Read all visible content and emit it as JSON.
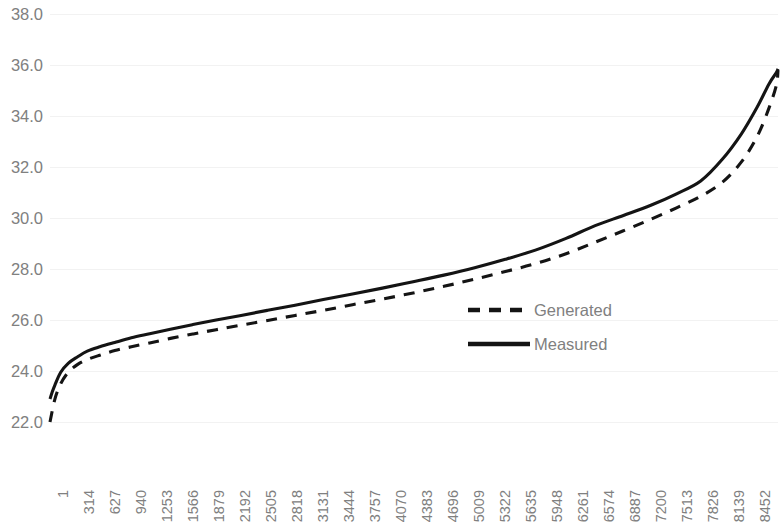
{
  "chart_data": {
    "type": "line",
    "title": "",
    "subtitle": "",
    "xlabel": "",
    "ylabel": "",
    "ylim": [
      22.0,
      38.0
    ],
    "ytick_step": 2.0,
    "ytick_labels": [
      "38.0",
      "36.0",
      "34.0",
      "32.0",
      "30.0",
      "28.0",
      "26.0",
      "24.0",
      "22.0"
    ],
    "ytick_values": [
      38.0,
      36.0,
      34.0,
      32.0,
      30.0,
      28.0,
      26.0,
      24.0,
      22.0
    ],
    "xtick_labels": [
      "1",
      "314",
      "627",
      "940",
      "1253",
      "1566",
      "1879",
      "2192",
      "2505",
      "2818",
      "3131",
      "3444",
      "3757",
      "4070",
      "4383",
      "4696",
      "5009",
      "5322",
      "5635",
      "5948",
      "6261",
      "6574",
      "6887",
      "7200",
      "7513",
      "7826",
      "8139",
      "8452"
    ],
    "xtick_values": [
      1,
      314,
      627,
      940,
      1253,
      1566,
      1879,
      2192,
      2505,
      2818,
      3131,
      3444,
      3757,
      4070,
      4383,
      4696,
      5009,
      5322,
      5635,
      5948,
      6261,
      6574,
      6887,
      7200,
      7513,
      7826,
      8139,
      8452
    ],
    "xlim": [
      1,
      8760
    ],
    "grid": true,
    "grid_axis": "y",
    "grid_color": "#f2f2f2",
    "legend_position": "center-right",
    "series": [
      {
        "name": "Generated",
        "style": "dashed",
        "color": "#141414",
        "x": [
          1,
          60,
          130,
          220,
          330,
          450,
          600,
          780,
          980,
          1200,
          1450,
          1720,
          2000,
          2300,
          2620,
          2950,
          3290,
          3640,
          4000,
          4370,
          4740,
          5110,
          5480,
          5850,
          6210,
          6560,
          6900,
          7230,
          7540,
          7830,
          8090,
          8320,
          8510,
          8650,
          8740,
          8760
        ],
        "y": [
          22.0,
          22.9,
          23.5,
          23.95,
          24.25,
          24.45,
          24.62,
          24.8,
          24.95,
          25.1,
          25.28,
          25.45,
          25.62,
          25.8,
          25.98,
          26.18,
          26.38,
          26.6,
          26.82,
          27.06,
          27.32,
          27.6,
          27.9,
          28.22,
          28.6,
          29.05,
          29.5,
          29.95,
          30.4,
          30.85,
          31.4,
          32.2,
          33.2,
          34.3,
          35.2,
          35.8
        ]
      },
      {
        "name": "Measured",
        "style": "solid",
        "color": "#141414",
        "x": [
          1,
          25,
          60,
          130,
          220,
          330,
          450,
          600,
          780,
          980,
          1200,
          1450,
          1720,
          2000,
          2300,
          2620,
          2950,
          3290,
          3640,
          4000,
          4370,
          4740,
          5110,
          5480,
          5850,
          6210,
          6560,
          6900,
          7230,
          7540,
          7830,
          8090,
          8320,
          8510,
          8650,
          8740,
          8760
        ],
        "y": [
          22.9,
          23.15,
          23.45,
          23.95,
          24.3,
          24.55,
          24.78,
          24.95,
          25.12,
          25.3,
          25.46,
          25.64,
          25.82,
          26.0,
          26.18,
          26.38,
          26.58,
          26.8,
          27.02,
          27.25,
          27.5,
          27.76,
          28.05,
          28.38,
          28.75,
          29.2,
          29.7,
          30.1,
          30.5,
          30.95,
          31.45,
          32.3,
          33.3,
          34.35,
          35.25,
          35.7,
          35.85
        ]
      }
    ]
  },
  "legend": {
    "entries": [
      {
        "label": "Generated",
        "style": "dashed"
      },
      {
        "label": "Measured",
        "style": "solid"
      }
    ]
  },
  "colors": {
    "line": "#141414",
    "axis_text": "#808080",
    "gridline": "#f2f2f2",
    "background": "#ffffff"
  }
}
